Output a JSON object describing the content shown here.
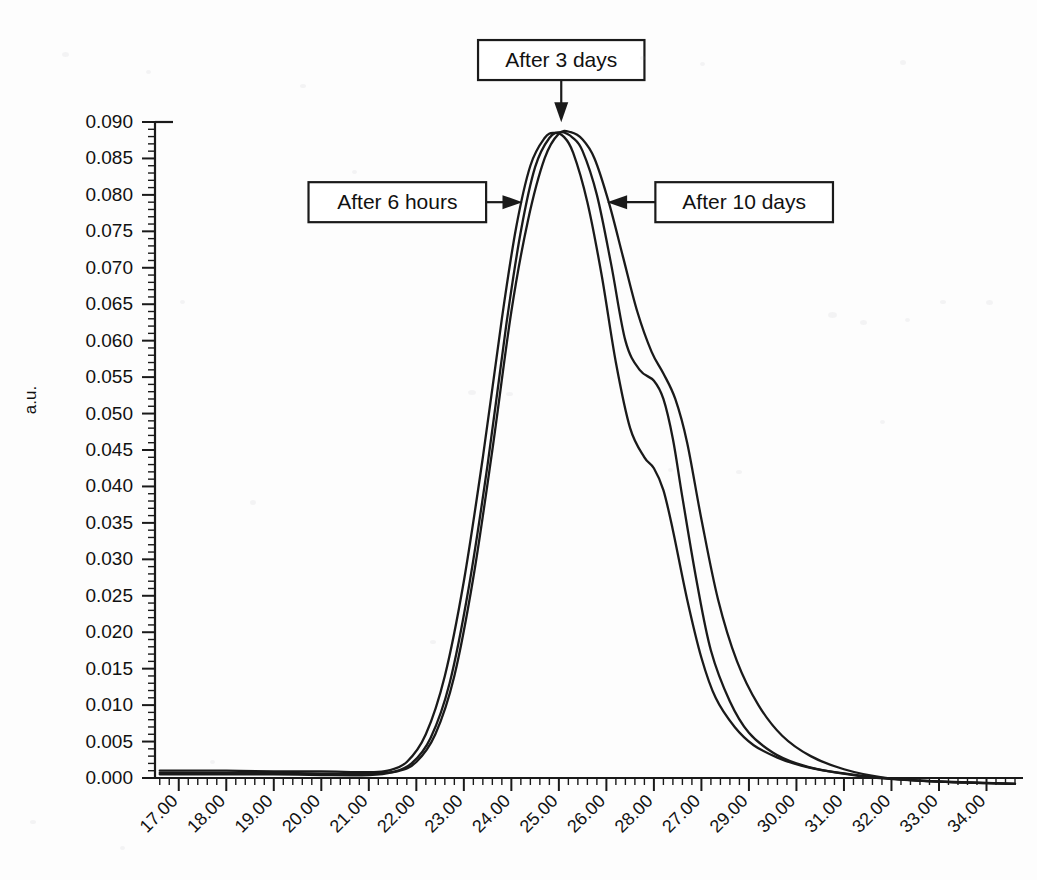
{
  "chart_data": {
    "type": "line",
    "title": "",
    "xlabel": "",
    "ylabel": "a.u.",
    "grid": false,
    "legend_position": "none",
    "xlim": [
      16.5,
      34.6
    ],
    "ylim": [
      -0.003,
      0.0925
    ],
    "x_tick_labels": [
      "17.00",
      "18.00",
      "19.00",
      "20.00",
      "21.00",
      "22.00",
      "23.00",
      "24.00",
      "25.00",
      "26.00",
      "28.00",
      "27.00",
      "29.00",
      "30.00",
      "31.00",
      "32.00",
      "33.00",
      "34.00"
    ],
    "x_tick_values": [
      17,
      18,
      19,
      20,
      21,
      22,
      23,
      24,
      25,
      26,
      27,
      28,
      29,
      30,
      31,
      32,
      33,
      34
    ],
    "x_minor_per_major": 5,
    "y_tick_labels": [
      "0.090",
      "0.085",
      "0.080",
      "0.075",
      "0.070",
      "0.065",
      "0.060",
      "0.055",
      "0.050",
      "0.045",
      "0.040",
      "0.035",
      "0.030",
      "0.025",
      "0.020",
      "0.015",
      "0.010",
      "0.005",
      "0.000"
    ],
    "y_tick_values": [
      0.09,
      0.085,
      0.08,
      0.075,
      0.07,
      0.065,
      0.06,
      0.055,
      0.05,
      0.045,
      0.04,
      0.035,
      0.03,
      0.025,
      0.02,
      0.015,
      0.01,
      0.005,
      0.0
    ],
    "y_minor_per_major": 5,
    "series": [
      {
        "name": "After 6 hours",
        "x": [
          16.6,
          17.0,
          18.0,
          19.0,
          20.0,
          21.0,
          21.4,
          21.8,
          22.2,
          22.6,
          23.0,
          23.4,
          23.8,
          24.1,
          24.4,
          24.7,
          24.9,
          25.1,
          25.3,
          25.6,
          25.9,
          26.2,
          26.5,
          26.8,
          27.0,
          27.2,
          27.4,
          27.7,
          28.0,
          28.3,
          28.7,
          29.1,
          29.6,
          30.1,
          30.7,
          31.4,
          32.2,
          33.0,
          34.0,
          34.6
        ],
        "y": [
          0.001,
          0.001,
          0.001,
          0.0009,
          0.0009,
          0.0008,
          0.001,
          0.0022,
          0.006,
          0.014,
          0.027,
          0.044,
          0.063,
          0.0755,
          0.084,
          0.0878,
          0.0885,
          0.088,
          0.0858,
          0.079,
          0.069,
          0.057,
          0.048,
          0.044,
          0.0425,
          0.0395,
          0.034,
          0.0245,
          0.0165,
          0.011,
          0.007,
          0.0045,
          0.0028,
          0.0017,
          0.0009,
          0.0003,
          -0.0002,
          -0.0005,
          -0.0007,
          -0.0008
        ]
      },
      {
        "name": "After 3 days",
        "x": [
          16.6,
          17.0,
          18.0,
          19.0,
          20.0,
          21.0,
          21.5,
          21.9,
          22.3,
          22.7,
          23.1,
          23.5,
          23.9,
          24.2,
          24.5,
          24.8,
          25.05,
          25.3,
          25.5,
          25.8,
          26.1,
          26.4,
          26.7,
          27.0,
          27.2,
          27.4,
          27.6,
          27.9,
          28.2,
          28.6,
          29.0,
          29.5,
          30.0,
          30.6,
          31.3,
          32.1,
          33.0,
          34.0,
          34.6
        ],
        "y": [
          0.0005,
          0.0005,
          0.0005,
          0.0005,
          0.0004,
          0.0004,
          0.0008,
          0.002,
          0.0055,
          0.013,
          0.026,
          0.043,
          0.0625,
          0.075,
          0.0838,
          0.0878,
          0.0886,
          0.0878,
          0.086,
          0.08,
          0.0705,
          0.06,
          0.056,
          0.0545,
          0.052,
          0.0465,
          0.0385,
          0.027,
          0.0175,
          0.0105,
          0.0062,
          0.0035,
          0.002,
          0.001,
          0.0003,
          -0.0002,
          -0.0005,
          -0.0007,
          -0.0008
        ]
      },
      {
        "name": "After 10 days",
        "x": [
          16.6,
          17.0,
          18.0,
          19.0,
          20.0,
          21.0,
          21.6,
          22.0,
          22.4,
          22.8,
          23.2,
          23.6,
          24.0,
          24.35,
          24.7,
          25.0,
          25.25,
          25.5,
          25.75,
          26.05,
          26.35,
          26.65,
          26.95,
          27.2,
          27.45,
          27.7,
          28.0,
          28.35,
          28.75,
          29.2,
          29.7,
          30.3,
          31.0,
          31.8,
          32.7,
          33.6,
          34.6
        ],
        "y": [
          0.0007,
          0.0007,
          0.0007,
          0.0007,
          0.0006,
          0.0006,
          0.0009,
          0.0022,
          0.006,
          0.014,
          0.0275,
          0.045,
          0.064,
          0.0765,
          0.085,
          0.0884,
          0.0886,
          0.0876,
          0.085,
          0.079,
          0.0715,
          0.064,
          0.0585,
          0.0555,
          0.052,
          0.046,
          0.0355,
          0.0245,
          0.016,
          0.01,
          0.0058,
          0.003,
          0.0012,
          0.0001,
          -0.0004,
          -0.0006,
          -0.0008
        ]
      }
    ],
    "annotations": [
      {
        "label": "After 3 days",
        "target_x": 25.1,
        "target_y": 0.0905,
        "box_x": 25.05,
        "box_y": 0.0985,
        "arrow": "down"
      },
      {
        "label": "After 6 hours",
        "target_x": 24.15,
        "target_y": 0.079,
        "box_x": 21.6,
        "box_y": 0.079,
        "arrow": "right"
      },
      {
        "label": "After 10 days",
        "target_x": 26.1,
        "target_y": 0.079,
        "box_x": 28.9,
        "box_y": 0.079,
        "arrow": "left"
      }
    ]
  },
  "colors": {
    "curve": "#1a1a1a",
    "axis": "#1a1a1a",
    "text": "#111111",
    "background": "#fdfdfd",
    "box_fill": "#ffffff"
  }
}
